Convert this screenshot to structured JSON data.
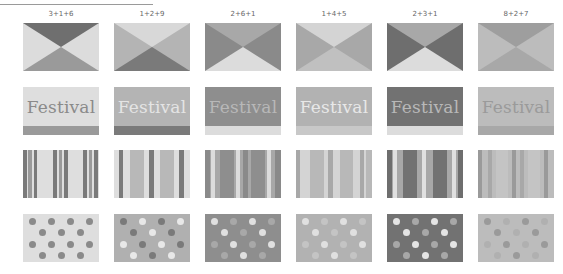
{
  "header": {
    "rule": true
  },
  "variants": [
    {
      "label": "3+1+6",
      "x": 23,
      "triangle": {
        "top": "#6f6f6f",
        "sides": "#dcdcdc",
        "bottom": "#9a9a9a"
      },
      "festival": {
        "bg": "#dedede",
        "text": "Festival",
        "text_color": "#8a8a8a",
        "band": "#9a9a9a"
      },
      "stripes": {
        "bg": "#dedede",
        "bars": [
          [
            0,
            4,
            "#7a7a7a"
          ],
          [
            5,
            4,
            "#9a9a9a"
          ],
          [
            11,
            3,
            "#7a7a7a"
          ],
          [
            30,
            4,
            "#7a7a7a"
          ],
          [
            36,
            3,
            "#9a9a9a"
          ],
          [
            41,
            4,
            "#7a7a7a"
          ],
          [
            60,
            4,
            "#7a7a7a"
          ],
          [
            66,
            3,
            "#9a9a9a"
          ],
          [
            71,
            4,
            "#7a7a7a"
          ]
        ]
      },
      "dots": {
        "bg": "#dedede",
        "a": "#8a8a8a",
        "b": "#8a8a8a"
      }
    },
    {
      "label": "1+2+9",
      "x": 114,
      "triangle": {
        "top": "#d8d8d8",
        "sides": "#b4b4b4",
        "bottom": "#7a7a7a"
      },
      "festival": {
        "bg": "#b4b4b4",
        "text": "Festival",
        "text_color": "#e4e4e4",
        "band": "#7a7a7a"
      },
      "stripes": {
        "bg": "#dedede",
        "bars": [
          [
            5,
            4,
            "#7a7a7a"
          ],
          [
            16,
            14,
            "#b8b8b8"
          ],
          [
            35,
            5,
            "#7a7a7a"
          ],
          [
            46,
            14,
            "#b8b8b8"
          ],
          [
            65,
            5,
            "#7a7a7a"
          ]
        ]
      },
      "dots": {
        "bg": "#b0b0b0",
        "a": "#7a7a7a",
        "b": "#e8e8e8"
      }
    },
    {
      "label": "2+6+1",
      "x": 205,
      "triangle": {
        "top": "#a8a8a8",
        "sides": "#8a8a8a",
        "bottom": "#dcdcdc"
      },
      "festival": {
        "bg": "#8e8e8e",
        "text": "Festival",
        "text_color": "#b8b8b8",
        "band": "#dcdcdc"
      },
      "stripes": {
        "bg": "#a8a8a8",
        "bars": [
          [
            0,
            5,
            "#8a8a8a"
          ],
          [
            6,
            4,
            "#dcdcdc"
          ],
          [
            15,
            14,
            "#8e8e8e"
          ],
          [
            31,
            4,
            "#dcdcdc"
          ],
          [
            38,
            5,
            "#8a8a8a"
          ],
          [
            46,
            14,
            "#8e8e8e"
          ],
          [
            62,
            4,
            "#dcdcdc"
          ],
          [
            70,
            6,
            "#8a8a8a"
          ]
        ]
      },
      "dots": {
        "bg": "#8e8e8e",
        "a": "#e0e0e0",
        "b": "#a8a8a8"
      }
    },
    {
      "label": "1+4+5",
      "x": 296,
      "triangle": {
        "top": "#d4d4d4",
        "sides": "#a8a8a8",
        "bottom": "#c0c0c0"
      },
      "festival": {
        "bg": "#b2b2b2",
        "text": "Festival",
        "text_color": "#e8e8e8",
        "band": "#c8c8c8"
      },
      "stripes": {
        "bg": "#d4d4d4",
        "bars": [
          [
            0,
            4,
            "#a8a8a8"
          ],
          [
            14,
            14,
            "#b8b8b8"
          ],
          [
            32,
            5,
            "#a8a8a8"
          ],
          [
            44,
            13,
            "#b8b8b8"
          ],
          [
            64,
            4,
            "#a8a8a8"
          ],
          [
            70,
            6,
            "#b8b8b8"
          ]
        ]
      },
      "dots": {
        "bg": "#b2b2b2",
        "a": "#e0e0e0",
        "b": "#c4c4c4"
      }
    },
    {
      "label": "2+3+1",
      "x": 387,
      "triangle": {
        "top": "#a8a8a8",
        "sides": "#6e6e6e",
        "bottom": "#dcdcdc"
      },
      "festival": {
        "bg": "#727272",
        "text": "Festival",
        "text_color": "#b8b8b8",
        "band": "#dcdcdc"
      },
      "stripes": {
        "bg": "#a8a8a8",
        "bars": [
          [
            0,
            5,
            "#6e6e6e"
          ],
          [
            6,
            4,
            "#e0e0e0"
          ],
          [
            16,
            14,
            "#727272"
          ],
          [
            35,
            4,
            "#e0e0e0"
          ],
          [
            46,
            14,
            "#727272"
          ],
          [
            65,
            4,
            "#e0e0e0"
          ],
          [
            71,
            5,
            "#6e6e6e"
          ]
        ]
      },
      "dots": {
        "bg": "#727272",
        "a": "#e4e4e4",
        "b": "#a8a8a8"
      }
    },
    {
      "label": "8+2+7",
      "x": 478,
      "triangle": {
        "top": "#9e9e9e",
        "sides": "#bcbcbc",
        "bottom": "#a8a8a8"
      },
      "festival": {
        "bg": "#bcbcbc",
        "text": "Festival",
        "text_color": "#9a9a9a",
        "band": "#a8a8a8"
      },
      "stripes": {
        "bg": "#bcbcbc",
        "bars": [
          [
            0,
            4,
            "#9a9a9a"
          ],
          [
            10,
            4,
            "#a8a8a8"
          ],
          [
            18,
            12,
            "#c4c4c4"
          ],
          [
            34,
            4,
            "#9a9a9a"
          ],
          [
            42,
            4,
            "#a8a8a8"
          ],
          [
            50,
            12,
            "#c4c4c4"
          ],
          [
            66,
            4,
            "#9a9a9a"
          ]
        ]
      },
      "dots": {
        "bg": "#bcbcbc",
        "a": "#9a9a9a",
        "b": "#b0b0b0"
      }
    }
  ],
  "rows": {
    "triangle_y": 23,
    "festival_y": 87,
    "stripes_y": 150,
    "dots_y": 214
  }
}
